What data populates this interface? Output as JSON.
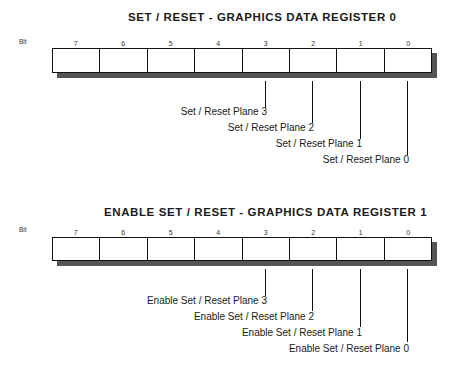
{
  "registers": [
    {
      "title": "SET / RESET - GRAPHICS DATA REGISTER 0",
      "bit_label": "Bit",
      "bits": [
        "7",
        "6",
        "5",
        "4",
        "3",
        "2",
        "1",
        "0"
      ],
      "fields": [
        {
          "bit": "3",
          "label": "Set / Reset Plane 3"
        },
        {
          "bit": "2",
          "label": "Set / Reset Plane 2"
        },
        {
          "bit": "1",
          "label": "Set / Reset Plane 1"
        },
        {
          "bit": "0",
          "label": "Set / Reset Plane 0"
        }
      ]
    },
    {
      "title": "ENABLE SET / RESET - GRAPHICS DATA REGISTER 1",
      "bit_label": "Bit",
      "bits": [
        "7",
        "6",
        "5",
        "4",
        "3",
        "2",
        "1",
        "0"
      ],
      "fields": [
        {
          "bit": "3",
          "label": "Enable Set / Reset Plane 3"
        },
        {
          "bit": "2",
          "label": "Enable Set / Reset Plane 2"
        },
        {
          "bit": "1",
          "label": "Enable Set / Reset Plane 1"
        },
        {
          "bit": "0",
          "label": "Enable Set / Reset Plane 0"
        }
      ]
    }
  ]
}
